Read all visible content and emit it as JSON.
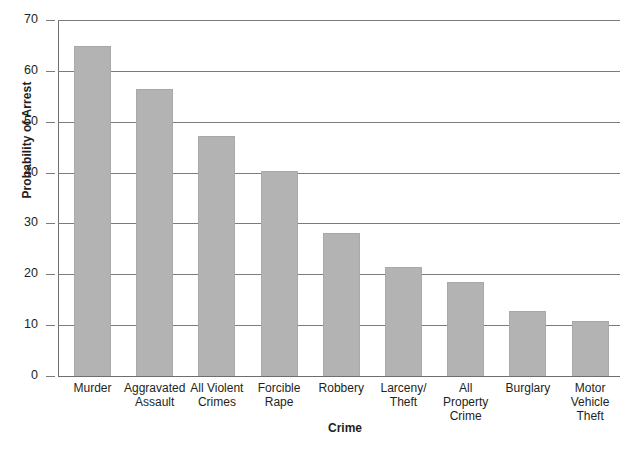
{
  "chart_data": {
    "type": "bar",
    "title": "",
    "xlabel": "Crime",
    "ylabel": "Probability of Arrest",
    "ylim": [
      0,
      70
    ],
    "ytick_step": 10,
    "yticks": [
      "0",
      "10",
      "20",
      "30",
      "40",
      "50",
      "60",
      "70"
    ],
    "grid": true,
    "legend": "none",
    "bar_color": "#b3b3b3",
    "categories": [
      "Murder",
      "Aggravated Assault",
      "All Violent Crimes",
      "Forcible Rape",
      "Robbery",
      "Larceny/ Theft",
      "All Property Crime",
      "Burglary",
      "Motor Vehicle Theft"
    ],
    "category_lines": [
      [
        "Murder"
      ],
      [
        "Aggravated",
        "Assault"
      ],
      [
        "All Violent",
        "Crimes"
      ],
      [
        "Forcible",
        "Rape"
      ],
      [
        "Robbery"
      ],
      [
        "Larceny/",
        "Theft"
      ],
      [
        "All",
        "Property",
        "Crime"
      ],
      [
        "Burglary"
      ],
      [
        "Motor",
        "Vehicle",
        "Theft"
      ]
    ],
    "values": [
      64.8,
      56.5,
      47.2,
      40.3,
      28.2,
      21.4,
      18.4,
      12.8,
      10.8
    ]
  }
}
